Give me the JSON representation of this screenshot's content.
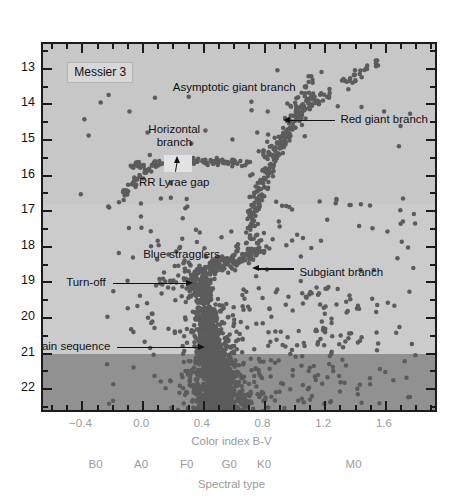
{
  "figure": {
    "title_badge": "Messier 3",
    "plot_background_light": "#c7c7c7",
    "plot_background_mid": "#cbcbcb",
    "plot_background_dark": "#919191",
    "point_color": "#5c5c5c",
    "axis_color": "#1b1b1b",
    "tick_label_color": "#9a9a9a"
  },
  "chart_data": {
    "type": "scatter",
    "title": "Messier 3",
    "xlabel": "Color index B-V",
    "ylabel": "",
    "secondary_xlabel": "Spectral type",
    "xlim": [
      -0.66,
      1.95
    ],
    "ylim": [
      22.7,
      12.3
    ],
    "y_inverted": true,
    "grid": false,
    "legend": "none",
    "xticks": [
      -0.4,
      0.0,
      0.4,
      0.8,
      1.2,
      1.6
    ],
    "xticklabels": [
      "−0.4",
      "0.0",
      "0.4",
      "0.8",
      "1.2",
      "1.6"
    ],
    "xtick_minor_step": 0.1,
    "yticks": [
      13,
      14,
      15,
      16,
      17,
      18,
      19,
      20,
      21,
      22
    ],
    "yticklabels": [
      "13",
      "14",
      "15",
      "16",
      "17",
      "18",
      "19",
      "20",
      "21",
      "22"
    ],
    "ytick_minor_step": 0.5,
    "spectral_types": [
      {
        "label": "B0",
        "bv": -0.3
      },
      {
        "label": "A0",
        "bv": 0.0
      },
      {
        "label": "F0",
        "bv": 0.3
      },
      {
        "label": "G0",
        "bv": 0.58
      },
      {
        "label": "K0",
        "bv": 0.81
      },
      {
        "label": "M0",
        "bv": 1.4
      }
    ],
    "shaded_bands": [
      {
        "from_mag": 12.3,
        "to_mag": 16.8,
        "color": "#c7c7c7"
      },
      {
        "from_mag": 16.8,
        "to_mag": 21.0,
        "color": "#cbcbcb"
      },
      {
        "from_mag": 21.0,
        "to_mag": 22.7,
        "color": "#919191"
      }
    ],
    "annotations": [
      {
        "name": "asymptotic-giant-branch",
        "text": "Asymptotic giant branch",
        "bv": 0.6,
        "mag": 13.55,
        "arrow": "none"
      },
      {
        "name": "red-giant-branch",
        "text": "Red giant branch",
        "bv": 1.3,
        "mag": 14.45,
        "arrow": "left",
        "target_bv": 0.92,
        "target_mag": 14.45
      },
      {
        "name": "horizontal-branch",
        "text": "Horizontal branch",
        "bv": 0.205,
        "mag": 14.96,
        "arrow": "down",
        "target_bv": 0.225,
        "target_mag": 15.55
      },
      {
        "name": "rr-lyrae-gap",
        "text": "RR Lyrae gap",
        "bv": 0.205,
        "mag": 16.22,
        "arrow": "none"
      },
      {
        "name": "blue-stragglers",
        "text": "Blue stragglers",
        "bv": 0.0,
        "mag": 18.22,
        "arrow": "none"
      },
      {
        "name": "subgiant-branch",
        "text": "Subgiant branch",
        "bv": 1.03,
        "mag": 18.75,
        "arrow": "left",
        "target_bv": 0.72,
        "target_mag": 18.62
      },
      {
        "name": "turn-off",
        "text": "Turn-off",
        "bv": -0.22,
        "mag": 19.02,
        "arrow": "right",
        "target_bv": 0.33,
        "target_mag": 19.02
      },
      {
        "name": "main-sequence",
        "text": "Main sequence",
        "bv": -0.19,
        "mag": 20.82,
        "arrow": "right",
        "target_bv": 0.41,
        "target_mag": 20.82
      }
    ],
    "rr_lyrae_gap_box": {
      "bv_from": 0.135,
      "bv_to": 0.325,
      "mag_from": 15.42,
      "mag_to": 15.9
    },
    "populations": [
      {
        "name": "red giant branch",
        "n": 170,
        "bv_center": 0.95,
        "mag_center": 15.2
      },
      {
        "name": "asymptotic giant branch",
        "n": 40,
        "bv_center": 1.2,
        "mag_center": 13.6
      },
      {
        "name": "horizontal branch",
        "n": 95,
        "bv_center": 0.2,
        "mag_center": 15.62
      },
      {
        "name": "subgiant branch",
        "n": 120,
        "bv_center": 0.7,
        "mag_center": 18.5
      },
      {
        "name": "main sequence",
        "n": 900,
        "bv_center": 0.55,
        "mag_center": 20.6
      },
      {
        "name": "blue stragglers",
        "n": 30,
        "bv_center": 0.15,
        "mag_center": 18.6
      },
      {
        "name": "field stars",
        "n": 150,
        "bv_center": 1.05,
        "mag_center": 20.0
      }
    ],
    "n_points_total": 1505
  }
}
